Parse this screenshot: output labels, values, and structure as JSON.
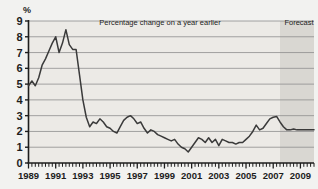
{
  "chart_data": {
    "type": "line",
    "title": "",
    "annotation": "Percentage change on a year earlier",
    "forecast_label": "Forecast",
    "xlabel": "",
    "ylabel": "%",
    "ylim": [
      0,
      9
    ],
    "yticks": [
      0,
      1,
      2,
      3,
      4,
      5,
      6,
      7,
      8,
      9
    ],
    "xlim": [
      1989.0,
      2010.0
    ],
    "xticks": [
      1989,
      1991,
      1993,
      1995,
      1997,
      1999,
      2001,
      2003,
      2005,
      2007,
      2009
    ],
    "xticklabels": [
      "1989",
      "1991",
      "1993",
      "1995",
      "1997",
      "1999",
      "2001",
      "2003",
      "2005",
      "2007",
      "2009"
    ],
    "grid": true,
    "minor_tick_interval_years": 0.25,
    "legend": "none",
    "forecast_start_x": 2007.5,
    "series": [
      {
        "name": "Percentage change on a year earlier",
        "x": [
          1989.0,
          1989.25,
          1989.5,
          1989.75,
          1990.0,
          1990.25,
          1990.5,
          1990.75,
          1991.0,
          1991.25,
          1991.5,
          1991.75,
          1992.0,
          1992.25,
          1992.5,
          1992.75,
          1993.0,
          1993.25,
          1993.5,
          1993.75,
          1994.0,
          1994.25,
          1994.5,
          1994.75,
          1995.0,
          1995.25,
          1995.5,
          1995.75,
          1996.0,
          1996.25,
          1996.5,
          1996.75,
          1997.0,
          1997.25,
          1997.5,
          1997.75,
          1998.0,
          1998.25,
          1998.5,
          1998.75,
          1999.0,
          1999.25,
          1999.5,
          1999.75,
          2000.0,
          2000.25,
          2000.5,
          2000.75,
          2001.0,
          2001.25,
          2001.5,
          2001.75,
          2002.0,
          2002.25,
          2002.5,
          2002.75,
          2003.0,
          2003.25,
          2003.5,
          2003.75,
          2004.0,
          2004.25,
          2004.5,
          2004.75,
          2005.0,
          2005.25,
          2005.5,
          2005.75,
          2006.0,
          2006.25,
          2006.5,
          2006.75,
          2007.0,
          2007.25,
          2007.5,
          2007.75,
          2008.0,
          2008.25,
          2008.5,
          2008.75,
          2009.0,
          2009.25,
          2009.5,
          2009.75,
          2010.0
        ],
        "values": [
          4.9,
          5.2,
          4.9,
          5.4,
          6.2,
          6.6,
          7.1,
          7.6,
          8.0,
          7.0,
          7.6,
          8.45,
          7.5,
          7.2,
          7.2,
          5.6,
          4.0,
          2.9,
          2.3,
          2.6,
          2.5,
          2.8,
          2.6,
          2.3,
          2.2,
          2.0,
          1.9,
          2.3,
          2.7,
          2.9,
          3.0,
          2.8,
          2.5,
          2.6,
          2.2,
          1.9,
          2.1,
          2.0,
          1.8,
          1.7,
          1.6,
          1.5,
          1.4,
          1.5,
          1.2,
          1.0,
          0.9,
          0.7,
          1.0,
          1.3,
          1.6,
          1.5,
          1.3,
          1.6,
          1.3,
          1.5,
          1.1,
          1.5,
          1.4,
          1.3,
          1.3,
          1.2,
          1.3,
          1.3,
          1.5,
          1.7,
          2.0,
          2.4,
          2.1,
          2.2,
          2.5,
          2.8,
          2.9,
          2.95,
          2.6,
          2.3,
          2.1,
          2.1,
          2.15,
          2.1,
          2.1,
          2.1,
          2.1,
          2.1,
          2.1
        ]
      }
    ]
  },
  "style": {
    "line_color": "#3a3a3a",
    "grid_color": "#8e8e8e",
    "axis_color": "#1d1d1d",
    "plot_bg": "#eceae6",
    "forecast_bg": "#d9d7d2",
    "page_bg": "#f2f2f0"
  }
}
